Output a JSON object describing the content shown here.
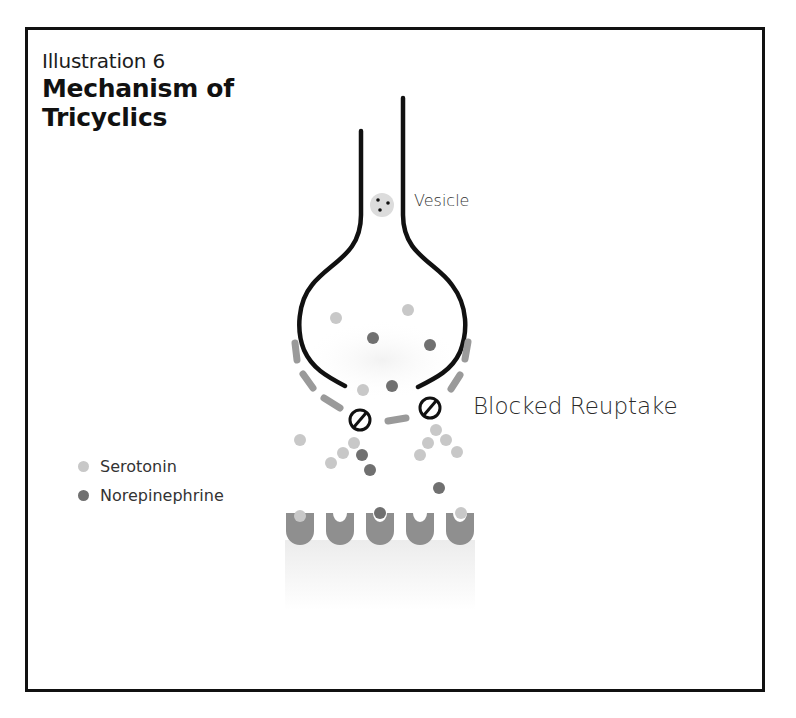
{
  "header": {
    "subtitle": "Illustration 6",
    "title_line1": "Mechanism of",
    "title_line2": "Tricyclics"
  },
  "labels": {
    "vesicle": "Vesicle",
    "blocked_reuptake": "Blocked Reuptake"
  },
  "legend": {
    "items": [
      {
        "label": "Serotonin",
        "color": "#c8c8c8"
      },
      {
        "label": "Norepinephrine",
        "color": "#707070"
      }
    ]
  },
  "colors": {
    "membrane": "#111111",
    "transporter": "#9a9a9a",
    "receptor": "#8f8f8f",
    "serotonin": "#c8c8c8",
    "norepinephrine": "#707070",
    "vesicle_fill": "#dcdcdc"
  },
  "molecules": {
    "serotonin": [
      [
        336,
        318
      ],
      [
        408,
        310
      ],
      [
        363,
        390
      ],
      [
        300,
        440
      ],
      [
        354,
        443
      ],
      [
        343,
        453
      ],
      [
        331,
        463
      ],
      [
        420,
        455
      ],
      [
        428,
        443
      ],
      [
        436,
        430
      ],
      [
        446,
        440
      ],
      [
        457,
        452
      ],
      [
        300,
        516
      ],
      [
        461,
        513
      ]
    ],
    "norepinephrine": [
      [
        373,
        338
      ],
      [
        430,
        345
      ],
      [
        392,
        386
      ],
      [
        362,
        455
      ],
      [
        370,
        470
      ],
      [
        439,
        488
      ],
      [
        380,
        513
      ]
    ]
  },
  "receptors": {
    "centers_x": [
      300,
      340,
      380,
      420,
      460
    ]
  }
}
